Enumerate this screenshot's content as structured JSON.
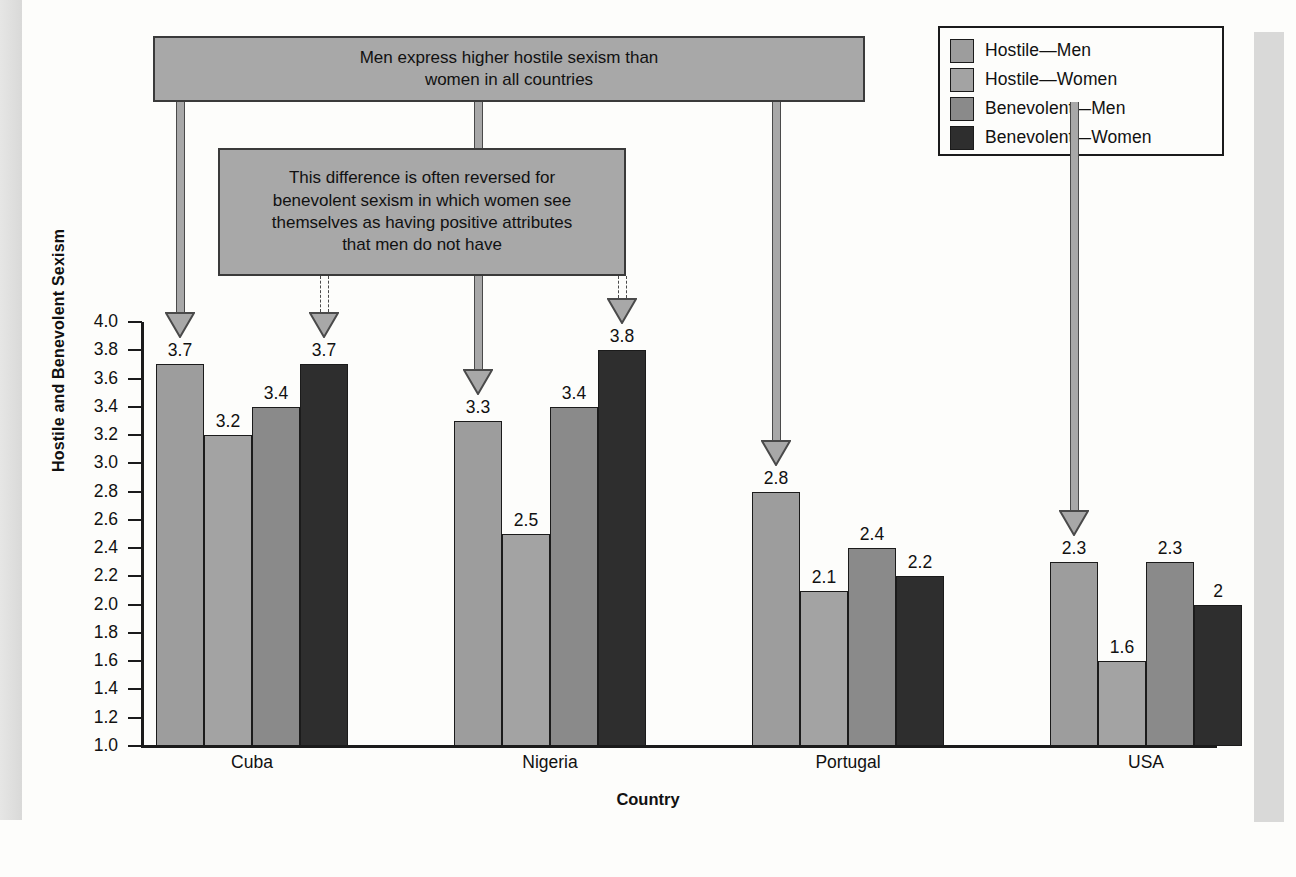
{
  "legend": {
    "items": [
      {
        "label": "Hostile—Men",
        "color": "#9d9d9d",
        "icon": "legend-swatch"
      },
      {
        "label": "Hostile—Women",
        "color": "#a3a3a3",
        "icon": "legend-swatch"
      },
      {
        "label": "Benevolent—Men",
        "color": "#8a8a8a",
        "icon": "legend-swatch"
      },
      {
        "label": "Benevolent—Women",
        "color": "#2e2e2e",
        "icon": "legend-swatch"
      }
    ]
  },
  "callouts": [
    {
      "id": "callout-men-hostile",
      "line1": "Men express higher hostile sexism than",
      "line2": "women in all countries"
    },
    {
      "id": "callout-benevolent-reversed",
      "line1": "This difference is often reversed for",
      "line2": "benevolent sexism in which women see",
      "line3": "themselves as having positive attributes",
      "line4": "that men do not have"
    }
  ],
  "chart_data": {
    "type": "bar",
    "title": "",
    "xlabel": "Country",
    "ylabel": "Hostile and Benevolent Sexism",
    "ylim": [
      1.0,
      4.0
    ],
    "ytick_step": 0.2,
    "ytick_labels": [
      "4.0",
      "3.8",
      "3.6",
      "3.4",
      "3.2",
      "3.0",
      "2.8",
      "2.6",
      "2.4",
      "2.2",
      "2.0",
      "1.8",
      "1.6",
      "1.4",
      "1.2",
      "1.0"
    ],
    "grid": false,
    "legend_position": "top-right",
    "categories": [
      "Cuba",
      "Nigeria",
      "Portugal",
      "USA",
      "England"
    ],
    "series": [
      {
        "name": "Hostile—Men",
        "color": "#9d9d9d",
        "values": [
          3.7,
          3.3,
          2.8,
          2.3,
          2.3
        ],
        "labels": [
          "3.7",
          "3.3",
          "2.8",
          "2.3",
          "2.3"
        ]
      },
      {
        "name": "Hostile—Women",
        "color": "#a3a3a3",
        "values": [
          3.2,
          2.5,
          2.1,
          1.6,
          1.7
        ],
        "labels": [
          "3.2",
          "2.5",
          "2.1",
          "1.6",
          "1.7"
        ]
      },
      {
        "name": "Benevolent—Men",
        "color": "#8a8a8a",
        "values": [
          3.4,
          3.4,
          2.4,
          2.3,
          2.0
        ],
        "labels": [
          "3.4",
          "3.4",
          "2.4",
          "2.3",
          "2"
        ]
      },
      {
        "name": "Benevolent—Women",
        "color": "#2e2e2e",
        "values": [
          3.7,
          3.8,
          2.2,
          2.0,
          1.9
        ],
        "labels": [
          "3.7",
          "3.8",
          "2.2",
          "2",
          "1.9"
        ]
      }
    ]
  }
}
